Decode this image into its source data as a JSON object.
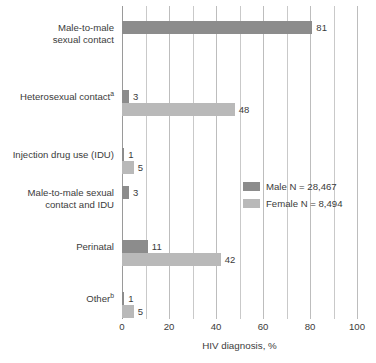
{
  "chart_data": {
    "type": "bar",
    "orientation": "horizontal",
    "title": "",
    "xlabel": "HIV diagnosis, %",
    "ylabel": "",
    "xlim": [
      0,
      100
    ],
    "xticks": [
      0,
      20,
      40,
      60,
      80,
      100
    ],
    "xtick_labels": [
      "0",
      "20",
      "40",
      "60",
      "80",
      "100"
    ],
    "gridline_interval": 10,
    "grid": true,
    "legend_position": "middle-right",
    "categories": [
      "Male-to-male sexual contact",
      "Heterosexual contactᵃ",
      "Injection drug use (IDU)",
      "Male-to-male sexual contact and IDU",
      "Perinatal",
      "Otherᵇ"
    ],
    "category_lines": [
      [
        "Male-to-male",
        "sexual contact"
      ],
      [
        "Heterosexual contact|a"
      ],
      [
        "Injection drug use (IDU)"
      ],
      [
        "Male-to-male sexual",
        "contact and IDU"
      ],
      [
        "Perinatal"
      ],
      [
        "Other|b"
      ]
    ],
    "series": [
      {
        "name": "Male",
        "legend_label": "Male N =  28,467",
        "n": "28,467",
        "color": "#8c8c8c",
        "values": [
          81,
          3,
          1,
          3,
          11,
          1
        ],
        "value_labels": [
          "81",
          "3",
          "1",
          "3",
          "11",
          "1"
        ]
      },
      {
        "name": "Female",
        "legend_label": "Female N =  8,494",
        "n": "8,494",
        "color": "#b9b9b9",
        "values": [
          0,
          48,
          5,
          0,
          42,
          5
        ],
        "value_labels": [
          "",
          "48",
          "5",
          "",
          "42",
          "5"
        ]
      }
    ],
    "footnote_markers": [
      "a",
      "b"
    ]
  },
  "legend": {
    "items": [
      {
        "label": "Male N =  28,467",
        "color": "#8c8c8c"
      },
      {
        "label": "Female N =  8,494",
        "color": "#b9b9b9"
      }
    ]
  },
  "axis": {
    "x_title": "HIV diagnosis, %",
    "ticks": [
      "0",
      "20",
      "40",
      "60",
      "80",
      "100"
    ]
  }
}
